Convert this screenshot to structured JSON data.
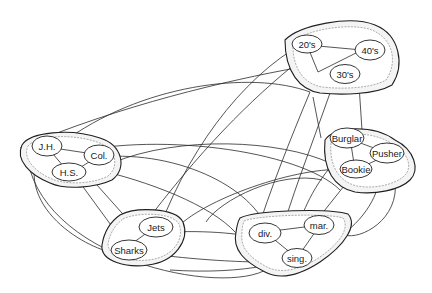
{
  "diagram": {
    "title": "",
    "pools": [
      {
        "id": "age",
        "units": [
          {
            "id": "u20",
            "label": "20's"
          },
          {
            "id": "u40",
            "label": "40's"
          },
          {
            "id": "u30",
            "label": "30's"
          }
        ]
      },
      {
        "id": "education",
        "units": [
          {
            "id": "jh",
            "label": "J.H."
          },
          {
            "id": "col",
            "label": "Col."
          },
          {
            "id": "hs",
            "label": "H.S."
          }
        ]
      },
      {
        "id": "occupation",
        "units": [
          {
            "id": "burglar",
            "label": "Burglar"
          },
          {
            "id": "pusher",
            "label": "Pusher"
          },
          {
            "id": "bookie",
            "label": "Bookie"
          }
        ]
      },
      {
        "id": "gang",
        "units": [
          {
            "id": "jets",
            "label": "Jets"
          },
          {
            "id": "sharks",
            "label": "Sharks"
          }
        ]
      },
      {
        "id": "marital",
        "units": [
          {
            "id": "div",
            "label": "div."
          },
          {
            "id": "mar",
            "label": "mar."
          },
          {
            "id": "sing",
            "label": "sing."
          }
        ]
      }
    ]
  },
  "labels": {
    "u20": "20's",
    "u40": "40's",
    "u30": "30's",
    "jh": "J.H.",
    "col": "Col.",
    "hs": "H.S.",
    "burglar": "Burglar",
    "pusher": "Pusher",
    "bookie": "Bookie",
    "jets": "Jets",
    "sharks": "Sharks",
    "div": "div.",
    "mar": "mar.",
    "sing": "sing."
  }
}
